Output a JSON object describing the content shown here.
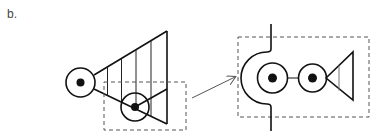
{
  "panel": {
    "label": "b."
  },
  "colors": {
    "stroke": "#111111",
    "dash": "#555555",
    "arrow": "#555555",
    "inner_line_gray": "#777777",
    "background": "#ffffff"
  },
  "left_figure": {
    "description": "Node (circle with dot) with fan/triangle of vertical lines; second node on lower edge; dashed selection box",
    "primary_node": {
      "cx": 80.5,
      "cy": 82.5,
      "r": 14.5,
      "dot_r": 4
    },
    "fan": {
      "apex_top": [
        167,
        31
      ],
      "apex_bottom": [
        167,
        124
      ],
      "vertical_lines_x": [
        107.5,
        121.5,
        136,
        151
      ]
    },
    "secondary_node": {
      "cx": 135,
      "cy": 107,
      "r": 14,
      "dot_r": 4
    },
    "selection_box": {
      "x": 104,
      "y": 82,
      "w": 82,
      "h": 48
    }
  },
  "arrow": {
    "from": [
      192,
      98
    ],
    "to": [
      235,
      77
    ]
  },
  "right_figure": {
    "description": "Zoomed view: boundary with semicircular notch, two nodes joined by a line, small triangle",
    "selection_box": {
      "x": 238,
      "y": 37,
      "w": 131,
      "h": 80
    },
    "node_1": {
      "cx": 272.5,
      "cy": 78,
      "r": 15,
      "dot_r": 4.5
    },
    "node_2": {
      "cx": 312.5,
      "cy": 78,
      "r": 14,
      "dot_r": 4.5
    },
    "triangle": {
      "left": [
        326,
        78
      ],
      "top_right": [
        353,
        52
      ],
      "bottom_right": [
        353,
        100
      ],
      "inner_line_x": 339
    }
  }
}
